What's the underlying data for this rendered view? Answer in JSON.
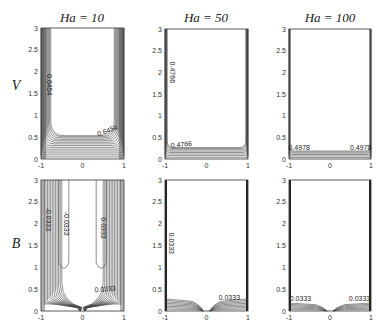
{
  "figure": {
    "row_labels": [
      "V",
      "B"
    ],
    "col_titles": [
      "Ha = 10",
      "Ha = 50",
      "Ha = 100"
    ]
  },
  "chart_data": [
    {
      "type": "contour",
      "row": "V",
      "title": "Ha = 10",
      "xlim": [
        -1,
        1
      ],
      "ylim": [
        0,
        3
      ],
      "xticks": [
        "-1",
        "0",
        "1"
      ],
      "yticks": [
        "0",
        "0.5",
        "1",
        "1.5",
        "2",
        "2.5",
        "3"
      ],
      "contour_labels": [
        {
          "text": "0.6454",
          "x": -0.85,
          "y": 1.7,
          "rot": 90
        },
        {
          "text": "0.6454",
          "x": 0.62,
          "y": 0.6,
          "rot": -20
        }
      ],
      "wall_layer": 0.25,
      "bottom_layer": 0.55,
      "levels": 14
    },
    {
      "type": "contour",
      "row": "V",
      "title": "Ha = 50",
      "xlim": [
        -1,
        1
      ],
      "ylim": [
        0,
        3
      ],
      "xticks": [
        "-1",
        "0",
        "1"
      ],
      "yticks": [
        "0",
        "0.5",
        "1",
        "1.5",
        "2",
        "2.5",
        "3"
      ],
      "contour_labels": [
        {
          "text": "0.4766",
          "x": -0.88,
          "y": 2.0,
          "rot": 90
        },
        {
          "text": "0.4766",
          "x": -0.6,
          "y": 0.28,
          "rot": -5
        }
      ],
      "wall_layer": 0.05,
      "bottom_layer": 0.28,
      "levels": 8
    },
    {
      "type": "contour",
      "row": "V",
      "title": "Ha = 100",
      "xlim": [
        -1,
        1
      ],
      "ylim": [
        0,
        3
      ],
      "xticks": [
        "-1",
        "0",
        "1"
      ],
      "yticks": [
        "0",
        "0.5",
        "1",
        "1.5",
        "2",
        "2.5",
        "3"
      ],
      "contour_labels": [
        {
          "text": "0.4978",
          "x": -0.75,
          "y": 0.2,
          "rot": 0
        },
        {
          "text": "0.4978",
          "x": 0.75,
          "y": 0.2,
          "rot": 0
        }
      ],
      "wall_layer": 0.02,
      "bottom_layer": 0.2,
      "levels": 6
    },
    {
      "type": "contour",
      "row": "B",
      "title": "Ha = 10",
      "xlim": [
        -1,
        1
      ],
      "ylim": [
        0,
        3
      ],
      "xticks": [
        "-1",
        "0",
        "1"
      ],
      "yticks": [
        "0",
        "0.5",
        "1",
        "1.5",
        "2",
        "2.5",
        "3"
      ],
      "contour_labels": [
        {
          "text": "-0.0333",
          "x": -0.88,
          "y": 2.1,
          "rot": 90
        },
        {
          "text": "-0.0333",
          "x": -0.45,
          "y": 2.0,
          "rot": 90
        },
        {
          "text": "0.0333",
          "x": 0.45,
          "y": 1.9,
          "rot": 90
        },
        {
          "text": "0.0333",
          "x": 0.55,
          "y": 0.45,
          "rot": -5
        }
      ],
      "levels": 12
    },
    {
      "type": "contour",
      "row": "B",
      "title": "Ha = 50",
      "xlim": [
        -1,
        1
      ],
      "ylim": [
        0,
        3
      ],
      "xticks": [
        "-1",
        "0",
        "1"
      ],
      "yticks": [
        "0",
        "0.5",
        "1",
        "1.5",
        "2",
        "2.5",
        "3"
      ],
      "contour_labels": [
        {
          "text": "0.0333",
          "x": -0.9,
          "y": 1.55,
          "rot": 90
        },
        {
          "text": "0.0333",
          "x": 0.55,
          "y": 0.25,
          "rot": 0
        }
      ],
      "levels": 8
    },
    {
      "type": "contour",
      "row": "B",
      "title": "Ha = 100",
      "xlim": [
        -1,
        1
      ],
      "ylim": [
        0,
        3
      ],
      "xticks": [
        "-1",
        "0",
        "1"
      ],
      "yticks": [
        "0",
        "0.5",
        "1",
        "1.5",
        "2",
        "2.5",
        "3"
      ],
      "contour_labels": [
        {
          "text": "0.0333",
          "x": -0.72,
          "y": 0.22,
          "rot": 0
        },
        {
          "text": "0.0333",
          "x": 0.72,
          "y": 0.22,
          "rot": 0
        }
      ],
      "levels": 6
    }
  ]
}
